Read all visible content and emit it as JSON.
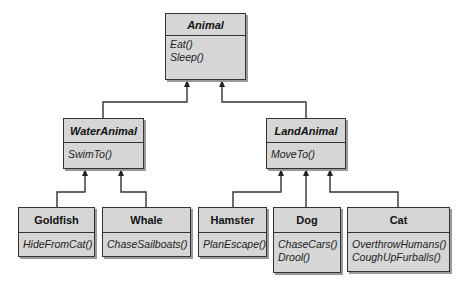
{
  "diagram": {
    "type": "uml-class-hierarchy",
    "classes": [
      {
        "id": "animal",
        "name": "Animal",
        "abstract": true,
        "methods": [
          "Eat()",
          "Sleep()"
        ]
      },
      {
        "id": "wateranimal",
        "name": "WaterAnimal",
        "abstract": true,
        "methods": [
          "SwimTo()"
        ]
      },
      {
        "id": "landanimal",
        "name": "LandAnimal",
        "abstract": true,
        "methods": [
          "MoveTo()"
        ]
      },
      {
        "id": "goldfish",
        "name": "Goldfish",
        "abstract": false,
        "methods": [
          "HideFromCat()"
        ]
      },
      {
        "id": "whale",
        "name": "Whale",
        "abstract": false,
        "methods": [
          "ChaseSailboats()"
        ]
      },
      {
        "id": "hamster",
        "name": "Hamster",
        "abstract": false,
        "methods": [
          "PlanEscape()"
        ]
      },
      {
        "id": "dog",
        "name": "Dog",
        "abstract": false,
        "methods": [
          "ChaseCars()",
          "Drool()"
        ]
      },
      {
        "id": "cat",
        "name": "Cat",
        "abstract": false,
        "methods": [
          "OverthrowHumans()",
          "CoughUpFurballs()"
        ]
      }
    ],
    "inheritance": [
      {
        "child": "WaterAnimal",
        "parent": "Animal"
      },
      {
        "child": "LandAnimal",
        "parent": "Animal"
      },
      {
        "child": "Goldfish",
        "parent": "WaterAnimal"
      },
      {
        "child": "Whale",
        "parent": "WaterAnimal"
      },
      {
        "child": "Hamster",
        "parent": "LandAnimal"
      },
      {
        "child": "Dog",
        "parent": "LandAnimal"
      },
      {
        "child": "Cat",
        "parent": "LandAnimal"
      }
    ],
    "colors": {
      "box_fill": "#d6d6d6",
      "line": "#333333",
      "shadow": "#9a9a9a"
    }
  }
}
